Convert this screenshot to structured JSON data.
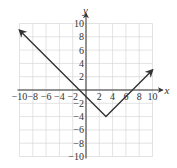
{
  "chart_data": {
    "type": "line",
    "title": "",
    "xlabel": "x",
    "ylabel": "y",
    "xlim": [
      -10,
      10
    ],
    "ylim": [
      -10,
      10
    ],
    "grid": true,
    "x_ticks": [
      -10,
      -8,
      -6,
      -4,
      -2,
      2,
      4,
      6,
      8,
      10
    ],
    "y_ticks": [
      10,
      8,
      6,
      4,
      2,
      -2,
      -4,
      -6,
      -8,
      -10
    ],
    "x_tick_labels": [
      "−10",
      "−8",
      "−6",
      "−4",
      "−2",
      "2",
      "4",
      "6",
      "8",
      "10"
    ],
    "y_tick_labels": [
      "10",
      "8",
      "6",
      "4",
      "2",
      "−2",
      "−4",
      "−6",
      "−8",
      "−10"
    ],
    "series": [
      {
        "name": "absolute value function",
        "points": [
          [
            -10,
            9
          ],
          [
            3,
            -4
          ],
          [
            10,
            3
          ]
        ],
        "vertex": [
          3,
          -4
        ],
        "x_intercepts": [
          -1,
          7
        ],
        "arrows_at_ends": true
      }
    ],
    "colors": {
      "line": "#333333",
      "grid": "#d0d0d0",
      "axis": "#333333"
    }
  }
}
